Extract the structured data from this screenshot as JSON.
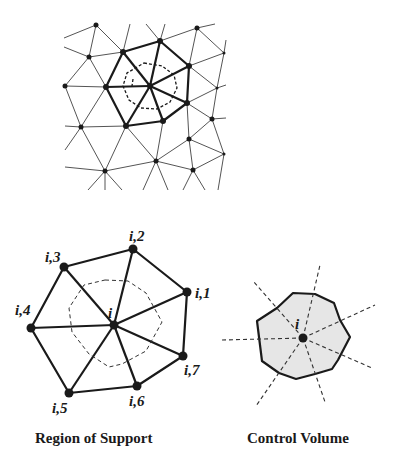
{
  "figure": {
    "top_panel": {
      "name": "Triangular mesh with highlighted node neighborhood"
    },
    "left_panel": {
      "caption": "Region of Support",
      "center_label": "i",
      "neighbor_labels": [
        "i,1",
        "i,2",
        "i,3",
        "i,4",
        "i,5",
        "i,6",
        "i,7"
      ]
    },
    "right_panel": {
      "caption": "Control Volume",
      "center_label": "i",
      "fill_color": "#e6e6e6"
    },
    "colors": {
      "line": "#1a1a1a",
      "thin_line": "#555555",
      "background": "#ffffff"
    }
  }
}
